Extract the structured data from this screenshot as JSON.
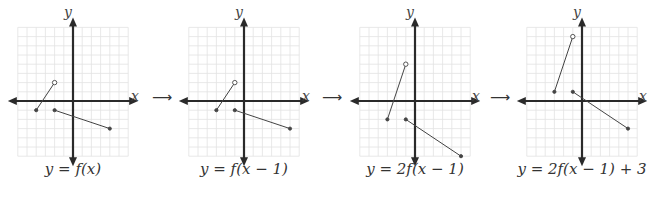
{
  "graphs": [
    {
      "caption": "y = f(x)",
      "origin": [
        73,
        101
      ],
      "x_label": "x",
      "y_label": "y",
      "segments": [
        {
          "from": [
            -4,
            -1
          ],
          "to": [
            -2,
            2
          ],
          "from_closed": true,
          "to_closed": false
        },
        {
          "from": [
            -2,
            -1
          ],
          "to": [
            4,
            -3
          ],
          "from_closed": true,
          "to_closed": true
        }
      ]
    },
    {
      "caption": "y = f(x − 1)",
      "origin": [
        244,
        101
      ],
      "x_label": "x",
      "y_label": "y",
      "segments": [
        {
          "from": [
            -3,
            -1
          ],
          "to": [
            -1,
            2
          ],
          "from_closed": true,
          "to_closed": false
        },
        {
          "from": [
            -1,
            -1
          ],
          "to": [
            5,
            -3
          ],
          "from_closed": true,
          "to_closed": true
        }
      ]
    },
    {
      "caption": "y = 2f(x − 1)",
      "origin": [
        415,
        101
      ],
      "x_label": "x",
      "y_label": "y",
      "segments": [
        {
          "from": [
            -3,
            -2
          ],
          "to": [
            -1,
            4
          ],
          "from_closed": true,
          "to_closed": false
        },
        {
          "from": [
            -1,
            -2
          ],
          "to": [
            5,
            -6
          ],
          "from_closed": true,
          "to_closed": true
        }
      ]
    },
    {
      "caption": "y = 2f(x − 1) + 3",
      "origin": [
        582,
        101
      ],
      "x_label": "x",
      "y_label": "y",
      "segments": [
        {
          "from": [
            -3,
            1
          ],
          "to": [
            -1,
            7
          ],
          "from_closed": true,
          "to_closed": false
        },
        {
          "from": [
            -1,
            1
          ],
          "to": [
            5,
            -3
          ],
          "from_closed": true,
          "to_closed": true
        }
      ]
    }
  ],
  "arrows": [
    "⟶",
    "⟶",
    "⟶"
  ],
  "grid": {
    "cell_px": 9.2,
    "cells_left": 6,
    "cells_right": 6,
    "cells_up": 8,
    "cells_down": 6
  },
  "colors": {
    "axis": "#2a2a2a",
    "grid": "#e2e2e2",
    "line": "#444444"
  }
}
